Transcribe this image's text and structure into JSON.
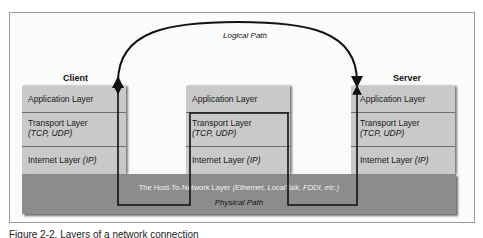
{
  "diagram": {
    "logical_path_label": "Logical Path",
    "physical_path_label": "Physical Path",
    "host_to_network": {
      "name": "The Host-To-Network Layer",
      "examples": "(Ethernet, LocalTalk, FDDI, etc.)"
    },
    "nodes": [
      {
        "title": "Client",
        "layers": {
          "application": "Application Layer",
          "transport": "Transport Layer",
          "transport_protocols": "(TCP, UDP)",
          "internet": "Internet Layer",
          "internet_protocol": "(IP)"
        }
      },
      {
        "title": "",
        "layers": {
          "application": "Application Layer",
          "transport": "Transport Layer",
          "transport_protocols": "(TCP, UDP)",
          "internet": "Internet Layer",
          "internet_protocol": "(IP)"
        }
      },
      {
        "title": "Server",
        "layers": {
          "application": "Application Layer",
          "transport": "Transport Layer",
          "transport_protocols": "(TCP, UDP)",
          "internet": "Internet Layer",
          "internet_protocol": "(IP)"
        }
      }
    ],
    "colors": {
      "layer_fill": "#c9c9c9",
      "host_band_fill": "#8c8c8c",
      "line": "#111111"
    }
  },
  "caption": "Figure 2-2. Layers of a network connection"
}
